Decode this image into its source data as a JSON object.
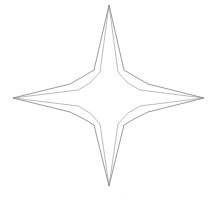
{
  "figure": {
    "background_color": "#ffffff",
    "canvas": {
      "width": 216,
      "height": 206
    },
    "stroke": {
      "outer_color": "#6e6e6e",
      "inner_color": "#8d8d8d",
      "outer_width": 0.7,
      "inner_width": 0.6
    },
    "tips": {
      "top_label": "top point",
      "right_label": "right point",
      "bottom_label": "bottom point",
      "left_label": "left point"
    },
    "geometry": {
      "outer_star_points": "109,5 124,70 134,76 148,84 204,98 148,112 134,119 124,125 109,186 94,125 84,119 70,112 13,98 70,84 84,76 94,70",
      "inner_star_points": "109,5 118,72 128,83 140,90 204,98 140,106 128,113 118,124 109,186 100,124 90,113 78,106 13,98 78,90 90,83 100,72"
    },
    "caption": {
      "text": "· ·· ··· ··",
      "visible": true,
      "color": "#ececec"
    }
  }
}
